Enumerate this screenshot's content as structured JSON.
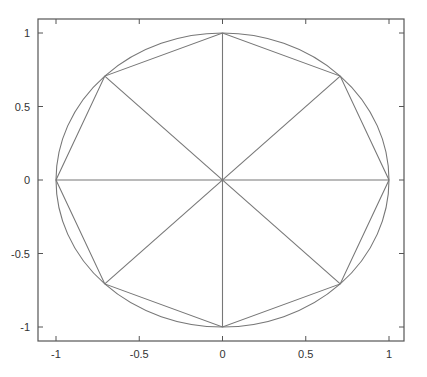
{
  "chart_data": {
    "type": "line",
    "title": "",
    "xlabel": "",
    "ylabel": "",
    "xlim": [
      -1.1,
      1.1
    ],
    "ylim": [
      -1.1,
      1.1
    ],
    "grid": false,
    "legend": null,
    "x_ticks": [
      -1,
      -0.5,
      0,
      0.5,
      1
    ],
    "x_tick_labels": [
      "-1",
      "-0.5",
      "0",
      "0.5",
      "1"
    ],
    "y_ticks": [
      -1,
      -0.5,
      0,
      0.5,
      1
    ],
    "y_tick_labels": [
      "-1",
      "-0.5",
      "0",
      "0.5",
      "1"
    ],
    "series": [
      {
        "name": "unit circle",
        "kind": "circle",
        "center": [
          0,
          0
        ],
        "radius": 1.0,
        "color": "#777777"
      },
      {
        "name": "octagon",
        "kind": "polygon",
        "x": [
          1,
          0.7071,
          0,
          -0.7071,
          -1,
          -0.7071,
          0,
          0.7071,
          1
        ],
        "y": [
          0,
          0.7071,
          1,
          0.7071,
          0,
          -0.7071,
          -1,
          -0.7071,
          0
        ],
        "color": "#777777"
      },
      {
        "name": "spokes",
        "kind": "segments",
        "segments": [
          [
            [
              -1,
              0
            ],
            [
              1,
              0
            ]
          ],
          [
            [
              0,
              -1
            ],
            [
              0,
              1
            ]
          ],
          [
            [
              -0.7071,
              -0.7071
            ],
            [
              0.7071,
              0.7071
            ]
          ],
          [
            [
              -0.7071,
              0.7071
            ],
            [
              0.7071,
              -0.7071
            ]
          ]
        ],
        "color": "#777777"
      }
    ]
  },
  "colors": {
    "line": "#777777",
    "axes": "#555555",
    "text": "#333333"
  }
}
